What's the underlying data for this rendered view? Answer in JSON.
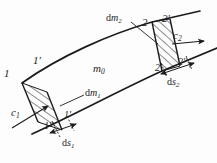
{
  "figure": {
    "type": "engineering-diagram",
    "background_color": "#fdfdfd",
    "line_color": "#1c1c1c"
  },
  "labels": {
    "point_1": "1",
    "point_1_prime": "1'",
    "point_1_double_prime": "1''",
    "point_2": "2",
    "point_2_prime": "2'",
    "point_2_double_prime": "2''",
    "mass_core": "m",
    "mass_core_sub": "0",
    "dm1_d": "d",
    "dm1_m": "m",
    "dm1_sub": "1",
    "dm2_d": "d",
    "dm2_m": "m",
    "dm2_sub": "2",
    "c1": "c",
    "c1_sub": "1",
    "c2": "c",
    "c2_sub": "2",
    "ds1_d": "d",
    "ds1_s": "s",
    "ds1_sub": "1",
    "ds2_d": "d",
    "ds2_s": "s",
    "ds2_sub": "2"
  },
  "geometry": {
    "upper_curve": "M 22,83 C 60,56 110,34 152,22 L 200,11",
    "lower_curve": "M 32,134 C 72,116 122,89 162,71 L 217,48",
    "inlet_face_upper": "M 22,83 L 38,122",
    "inlet_face_lower": "M 47,92 L 62,130",
    "outlet_face_upper": "M 152,22 L 162,71",
    "outlet_face_lower": "M 170,19 L 180,66",
    "hatch_left_fill": "M 22,83 L 38,122 L 62,130 L 47,92 Z",
    "hatch_right_fill": "M 152,22 L 162,71 L 180,66 L 170,19 Z",
    "arrow_c1": "M 14,127 L 48,105",
    "arrow_c2": "M 168,45 L 203,42",
    "dim_ds1": "M 49,133 L 75,124",
    "dim_ds2": "M 160,72 L 192,62",
    "leader_dm1": "M 63,104 L 84,94",
    "leader_dm2": "M 133,21 L 160,43"
  }
}
